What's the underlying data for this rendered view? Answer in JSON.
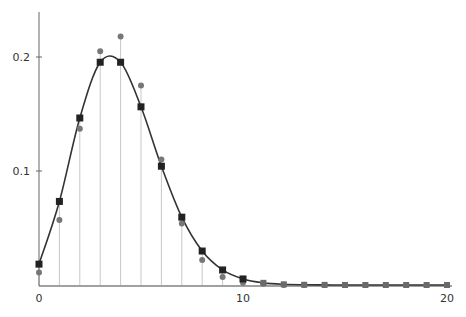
{
  "chart_data": {
    "type": "scatter",
    "title": "",
    "xlabel": "",
    "ylabel": "",
    "xlim": [
      0,
      20
    ],
    "ylim": [
      0,
      0.24
    ],
    "grid": false,
    "legend": null,
    "x_ticks": [
      0,
      10,
      20
    ],
    "x_tick_labels": [
      "0",
      "10",
      "20"
    ],
    "y_ticks": [
      0.1,
      0.2
    ],
    "y_tick_labels": [
      "0.1",
      "0.2"
    ],
    "x": [
      0,
      1,
      2,
      3,
      4,
      5,
      6,
      7,
      8,
      9,
      10,
      11,
      12,
      13,
      14,
      15,
      16,
      17,
      18,
      19,
      20
    ],
    "series": [
      {
        "name": "model (squares, connected by smooth curve)",
        "marker": "square",
        "color": "#222222",
        "values": [
          0.0183,
          0.0733,
          0.1465,
          0.1954,
          0.1954,
          0.1563,
          0.1042,
          0.0595,
          0.0298,
          0.0132,
          0.0053,
          0.0019,
          0.0006,
          0.0002,
          0.0001,
          0,
          0,
          0,
          0,
          0,
          0
        ]
      },
      {
        "name": "observed (circles)",
        "marker": "circle",
        "color": "#777777",
        "values": [
          0.011,
          0.057,
          0.137,
          0.205,
          0.218,
          0.175,
          0.11,
          0.054,
          0.022,
          0.007,
          0.002,
          0.001,
          0,
          0,
          0,
          0,
          0,
          0,
          0,
          0,
          0
        ]
      }
    ],
    "stems": true,
    "curve_color": "#333333",
    "stem_color": "#c8c8c8"
  }
}
